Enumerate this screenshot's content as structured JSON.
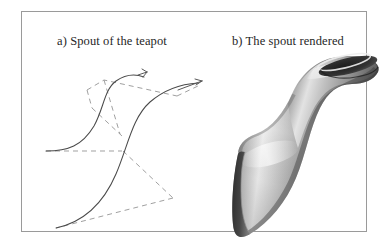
{
  "figure": {
    "background_color": "#ffffff",
    "frame": {
      "border_color": "#9a9a9a",
      "fill_color": "#ffffff"
    },
    "panels": [
      {
        "id": "wireframe",
        "caption": "a) Spout of the teapot",
        "type": "bezier-control-net",
        "curve_color": "#4a4a4a",
        "control_polygon_color": "#9b9b9b"
      },
      {
        "id": "render",
        "caption": "b) The spout rendered",
        "type": "shaded-3d-surface",
        "surface_light_color": "#f2f2f2",
        "surface_mid_color": "#a9a9a9",
        "surface_dark_color": "#4d4d4d",
        "opening_color": "#2a2a2a"
      }
    ]
  }
}
